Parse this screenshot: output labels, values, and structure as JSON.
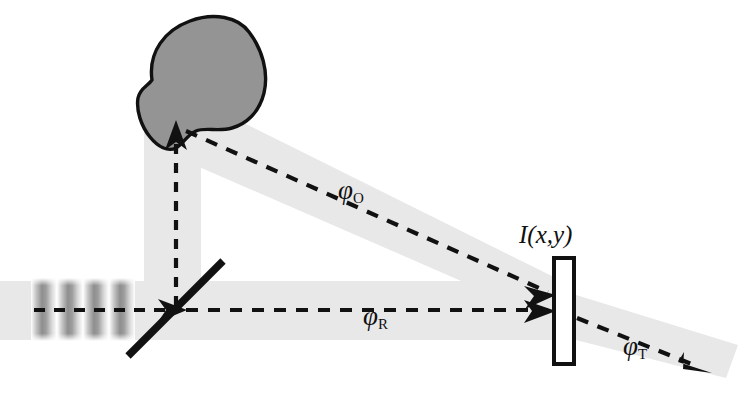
{
  "figure": {
    "type": "optical-setup-diagram",
    "background_color": "#ffffff",
    "beam_color": "#e8e8e8",
    "object_fill_color": "#949494",
    "outline_color": "#111111",
    "ray_color": "#111111"
  },
  "labels": {
    "object_wave": {
      "symbol": "φ",
      "subscript": "O",
      "text": "φO"
    },
    "reference_wave": {
      "symbol": "φ",
      "subscript": "R",
      "text": "φR"
    },
    "transmitted_wave": {
      "symbol": "φ",
      "subscript": "T",
      "text": "φT"
    },
    "intensity": {
      "text": "I(x,y)",
      "prefix": "I",
      "open": "(",
      "x": "x",
      "comma": ",",
      "y": "y",
      "close": ")"
    }
  },
  "components": {
    "fringe_pattern": {
      "name": "input-fringes",
      "stripe_count": 4,
      "description": "vertical interference fringes entering from the left"
    },
    "beam_splitter": {
      "name": "beam-splitter",
      "description": "thick diagonal line splitting the incoming beam"
    },
    "object": {
      "name": "scattering-object",
      "description": "irregular gray blob illuminated from below"
    },
    "detector": {
      "name": "ccd-detector",
      "description": "white rectangle recording the hologram intensity"
    }
  },
  "beams": [
    {
      "name": "input-beam",
      "label": null,
      "direction": "left-to-right"
    },
    {
      "name": "object-illumination-beam",
      "label": null,
      "direction": "upward"
    },
    {
      "name": "object-wave-beam",
      "label": "φO",
      "direction": "down-right"
    },
    {
      "name": "reference-wave-beam",
      "label": "φR",
      "direction": "left-to-right"
    },
    {
      "name": "transmitted-wave-beam",
      "label": "φT",
      "direction": "down-right"
    }
  ]
}
